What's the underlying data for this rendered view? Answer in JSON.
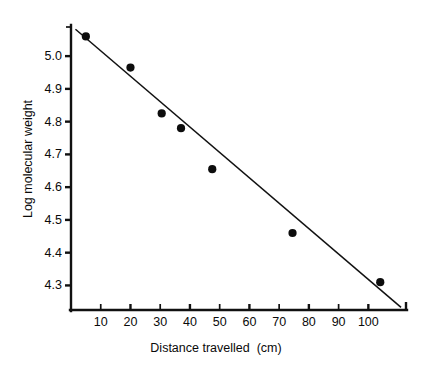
{
  "chart_data": {
    "type": "scatter",
    "title": "",
    "xlabel": "Distance travelled  (cm)",
    "ylabel": "Log molecular weight",
    "xlim": [
      0,
      113
    ],
    "ylim": [
      4.225,
      5.095
    ],
    "grid": false,
    "legend": null,
    "x_ticks": [
      10,
      20,
      30,
      40,
      50,
      60,
      70,
      80,
      90,
      100
    ],
    "x_tick_labels": [
      "10",
      "20",
      "30",
      "40",
      "50",
      "60",
      "70",
      "80",
      "90",
      "100"
    ],
    "y_ticks": [
      4.3,
      4.4,
      4.5,
      4.6,
      4.7,
      4.8,
      4.9,
      5.0
    ],
    "y_tick_labels": [
      "4.3",
      "4.4",
      "4.5",
      "4.6",
      "4.7",
      "4.8",
      "4.9",
      "5.0"
    ],
    "x": [
      5.0,
      20.0,
      30.5,
      37.0,
      47.5,
      74.5,
      104.0
    ],
    "y": [
      5.06,
      4.965,
      4.825,
      4.78,
      4.655,
      4.46,
      4.31
    ],
    "points": [
      {
        "x": 5.0,
        "y": 5.06
      },
      {
        "x": 20.0,
        "y": 4.965
      },
      {
        "x": 30.5,
        "y": 4.825
      },
      {
        "x": 37.0,
        "y": 4.78
      },
      {
        "x": 47.5,
        "y": 4.655
      },
      {
        "x": 74.5,
        "y": 4.46
      },
      {
        "x": 104.0,
        "y": 4.31
      }
    ],
    "series": [
      {
        "name": "Measured fragments",
        "type": "scatter",
        "marker": "filled-circle",
        "color": "#0d0d0d",
        "values": [
          5.06,
          4.965,
          4.825,
          4.78,
          4.655,
          4.46,
          4.31
        ]
      },
      {
        "name": "Fitted regression line",
        "type": "line",
        "color": "#111111",
        "endpoints": [
          {
            "x": 1.5,
            "y": 5.082
          },
          {
            "x": 111.0,
            "y": 4.233
          }
        ]
      }
    ],
    "annotations": []
  },
  "axes": {
    "y_title": "Log molecular weight",
    "x_title": "Distance travelled  (cm)"
  }
}
